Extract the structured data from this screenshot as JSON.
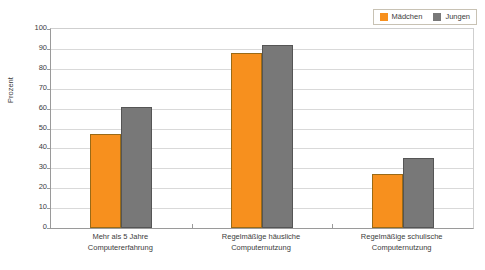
{
  "chart_data": {
    "type": "bar",
    "title": "",
    "subtitle": "",
    "xlabel": "",
    "ylabel": "Prozent",
    "ylim": [
      0,
      100
    ],
    "ytick_step": 10,
    "yticks": [
      100,
      90,
      80,
      70,
      60,
      50,
      40,
      30,
      20,
      10,
      0
    ],
    "grid": true,
    "legend_position": "top-right",
    "categories": [
      "Mehr als 5 Jahre Computererfahrung",
      "Regelmäßige häusliche Computernutzung",
      "Regelmäßige schulische Computernutzung"
    ],
    "category_lines": [
      [
        "Mehr als 5 Jahre",
        "Computererfahrung"
      ],
      [
        "Regelmäßige häusliche",
        "Computernutzung"
      ],
      [
        "Regelmäßige schulische",
        "Computernutzung"
      ]
    ],
    "series": [
      {
        "name": "Mädchen",
        "color": "#F7901E",
        "values": [
          47,
          88,
          27
        ]
      },
      {
        "name": "Jungen",
        "color": "#787878",
        "values": [
          61,
          92,
          35
        ]
      }
    ]
  },
  "legend": {
    "items": [
      {
        "label": "Mädchen",
        "color": "#F7901E"
      },
      {
        "label": "Jungen",
        "color": "#787878"
      }
    ]
  },
  "axes": {
    "y_title": "Prozent",
    "y_tick_labels": [
      "100",
      "90",
      "80",
      "70",
      "60",
      "50",
      "40",
      "30",
      "20",
      "10",
      "0"
    ]
  },
  "colors": {
    "girls": "#F7901E",
    "boys": "#787878",
    "gridline": "#d9d9d9",
    "axis": "#9a9a9a",
    "background": "#ffffff",
    "text": "#3c3c3c"
  }
}
